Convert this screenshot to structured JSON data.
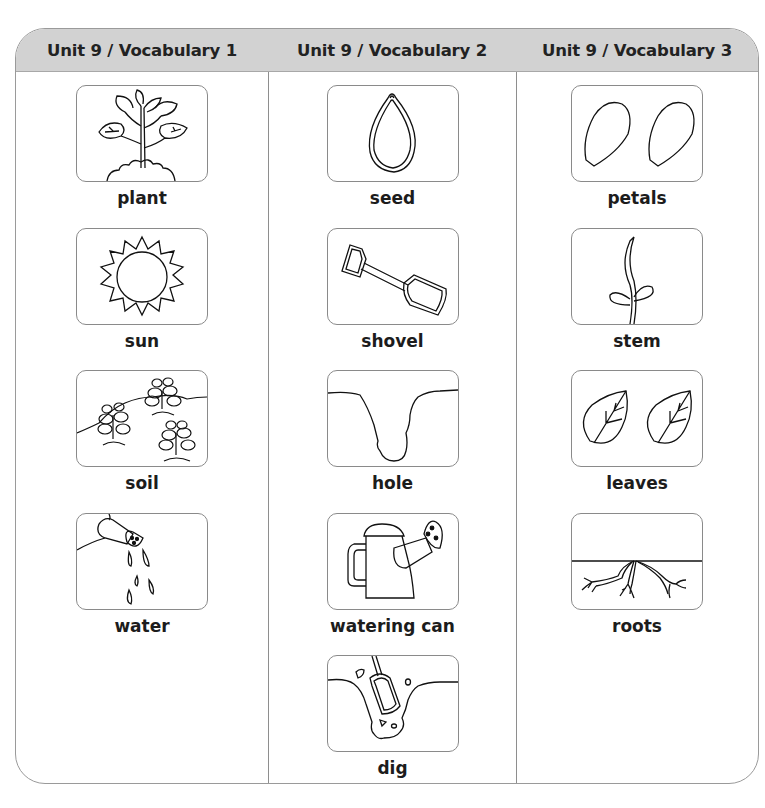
{
  "header": {
    "columns": [
      "Unit 9 / Vocabulary 1",
      "Unit 9 / Vocabulary 2",
      "Unit 9 / Vocabulary 3"
    ]
  },
  "columns": [
    {
      "items": [
        {
          "word": "plant",
          "icon": "plant-icon"
        },
        {
          "word": "sun",
          "icon": "sun-icon"
        },
        {
          "word": "soil",
          "icon": "soil-icon"
        },
        {
          "word": "water",
          "icon": "water-icon"
        }
      ]
    },
    {
      "items": [
        {
          "word": "seed",
          "icon": "seed-icon"
        },
        {
          "word": "shovel",
          "icon": "shovel-icon"
        },
        {
          "word": "hole",
          "icon": "hole-icon"
        },
        {
          "word": "watering can",
          "icon": "watering-can-icon"
        },
        {
          "word": "dig",
          "icon": "dig-icon"
        }
      ]
    },
    {
      "items": [
        {
          "word": "petals",
          "icon": "petals-icon"
        },
        {
          "word": "stem",
          "icon": "stem-icon"
        },
        {
          "word": "leaves",
          "icon": "leaves-icon"
        },
        {
          "word": "roots",
          "icon": "roots-icon"
        }
      ]
    }
  ],
  "colors": {
    "header_bg": "#d2d2d2",
    "border": "#9a9a9a",
    "text": "#1c1c1c"
  }
}
